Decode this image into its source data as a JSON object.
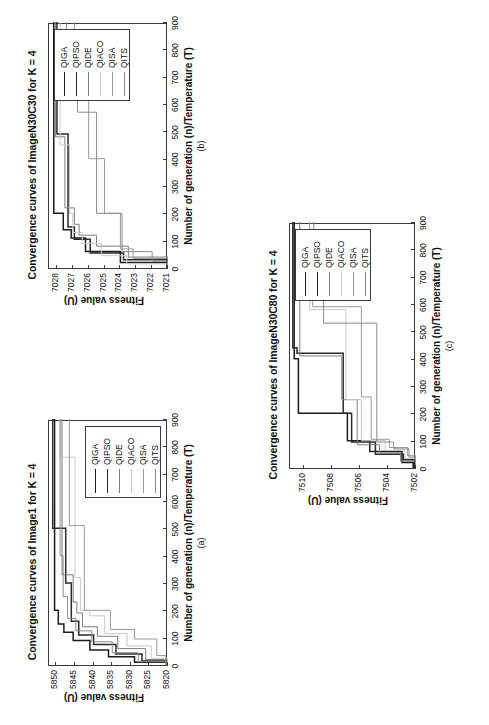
{
  "figure": {
    "series_names": [
      "QIGA",
      "QIPSO",
      "QIDE",
      "QIACO",
      "QISA",
      "QITS"
    ],
    "series_colors": [
      "#1c1c1c",
      "#2a2a2a",
      "#7d7d7d",
      "#c9c9c9",
      "#9a9a9a",
      "#8a8a8a"
    ],
    "xaxis_title": "Number of generation (n)/Temperature (T)",
    "yaxis_title": "Fitness value (U)"
  },
  "panels": [
    {
      "letter": "(a)",
      "title": "Convergence curves of Image1 for K = 4",
      "chart_data": {
        "type": "line",
        "title": "Convergence curves of Image1 for K = 4",
        "xlabel": "Number of generation (n)/Temperature (T)",
        "ylabel": "Fitness value (U)",
        "xlim": [
          0,
          900
        ],
        "ylim": [
          5820,
          5852
        ],
        "xticks": [
          0,
          100,
          200,
          300,
          400,
          500,
          600,
          700,
          800,
          900
        ],
        "yticks": [
          5820,
          5825,
          5830,
          5835,
          5840,
          5845,
          5850
        ],
        "grid": false,
        "legend_position": "lower-right",
        "series": [
          {
            "name": "QIGA",
            "color": "#1c1c1c",
            "x": [
              0,
              10,
              30,
              55,
              90,
              120,
              150,
              200,
              900
            ],
            "y": [
              5820.5,
              5829,
              5836,
              5841,
              5845.5,
              5848,
              5849.5,
              5850.5,
              5850.5
            ]
          },
          {
            "name": "QIPSO",
            "color": "#2a2a2a",
            "x": [
              0,
              15,
              40,
              75,
              110,
              160,
              300,
              480,
              500,
              900
            ],
            "y": [
              5820.3,
              5827,
              5834,
              5840,
              5844,
              5846,
              5847.5,
              5847.5,
              5851,
              5851
            ]
          },
          {
            "name": "QIDE",
            "color": "#7d7d7d",
            "x": [
              0,
              20,
              60,
              105,
              140,
              190,
              230,
              300,
              330,
              900
            ],
            "y": [
              5820.2,
              5826,
              5833.5,
              5839,
              5843,
              5844.5,
              5845.5,
              5845.5,
              5848.5,
              5848.5
            ]
          },
          {
            "name": "QIACO",
            "color": "#c9c9c9",
            "x": [
              0,
              25,
              70,
              115,
              180,
              200,
              290,
              320,
              700,
              760,
              900
            ],
            "y": [
              5820.1,
              5824.5,
              5831,
              5837,
              5841,
              5843.5,
              5843.5,
              5845,
              5845,
              5849,
              5849
            ]
          },
          {
            "name": "QISA",
            "color": "#9a9a9a",
            "x": [
              0,
              35,
              95,
              130,
              185,
              200,
              480,
              510,
              900
            ],
            "y": [
              5820.6,
              5823,
              5829,
              5835.5,
              5835.5,
              5842.5,
              5842.5,
              5846.5,
              5846.5
            ]
          },
          {
            "name": "QITS",
            "color": "#8a8a8a",
            "x": [
              0,
              12,
              45,
              85,
              125,
              170,
              250,
              400,
              900
            ],
            "y": [
              5820.4,
              5828,
              5835,
              5840.5,
              5844.8,
              5847,
              5848.2,
              5849,
              5849
            ]
          }
        ]
      }
    },
    {
      "letter": "(b)",
      "title": "Convergence curves of ImageN30C30 for K = 4",
      "chart_data": {
        "type": "line",
        "title": "Convergence curves of ImageN30C30 for K = 4",
        "xlabel": "Number of generation (n)/Temperature (T)",
        "ylabel": "Fitness value (U)",
        "xlim": [
          0,
          900
        ],
        "ylim": [
          7021,
          7028.5
        ],
        "xticks": [
          0,
          100,
          200,
          300,
          400,
          500,
          600,
          700,
          800,
          900
        ],
        "yticks": [
          7021,
          7022,
          7023,
          7024,
          7025,
          7026,
          7027,
          7028
        ],
        "grid": false,
        "legend_position": "upper-right",
        "series": [
          {
            "name": "QIGA",
            "color": "#1c1c1c",
            "x": [
              0,
              20,
              50,
              60,
              100,
              110,
              140,
              200,
              900
            ],
            "y": [
              7021.0,
              7024.0,
              7024.0,
              7026.2,
              7026.2,
              7027.1,
              7027.6,
              7028.2,
              7028.2
            ]
          },
          {
            "name": "QIPSO",
            "color": "#2a2a2a",
            "x": [
              0,
              30,
              55,
              95,
              105,
              150,
              460,
              490,
              900
            ],
            "y": [
              7021.0,
              7023.8,
              7025.9,
              7025.9,
              7026.9,
              7027.3,
              7027.3,
              7028.0,
              7028.0
            ]
          },
          {
            "name": "QIDE",
            "color": "#7d7d7d",
            "x": [
              0,
              40,
              80,
              120,
              160,
              210,
              220,
              440,
              480,
              900
            ],
            "y": [
              7021.0,
              7023.5,
              7025.5,
              7026.6,
              7026.9,
              7026.9,
              7027.5,
              7027.5,
              7028.1,
              7028.1
            ]
          },
          {
            "name": "QIACO",
            "color": "#c9c9c9",
            "x": [
              0,
              15,
              45,
              90,
              130,
              200,
              420,
              450,
              900
            ],
            "y": [
              7021.0,
              7023.6,
              7025.2,
              7026.4,
              7027.0,
              7027.2,
              7027.2,
              7027.8,
              7027.8
            ]
          },
          {
            "name": "QISA",
            "color": "#9a9a9a",
            "x": [
              0,
              35,
              70,
              110,
              190,
              200,
              380,
              400,
              700,
              730,
              900
            ],
            "y": [
              7021.0,
              7023.2,
              7024.0,
              7024.0,
              7024.0,
              7025.0,
              7025.0,
              7026.0,
              7026.0,
              7026.9,
              7026.9
            ]
          },
          {
            "name": "QITS",
            "color": "#8a8a8a",
            "x": [
              0,
              25,
              60,
              100,
              185,
              200,
              540,
              570,
              760,
              790,
              900
            ],
            "y": [
              7021.0,
              7022.0,
              7023.9,
              7023.9,
              7023.9,
              7025.5,
              7025.5,
              7026.7,
              7026.7,
              7027.4,
              7027.4
            ]
          }
        ]
      }
    },
    {
      "letter": "(c)",
      "title": "Convergence curves of ImageN30C80 for K = 4",
      "chart_data": {
        "type": "line",
        "title": "Convergence curves of ImageN30C80 for K = 4",
        "xlabel": "Number of generation (n)/Temperature (T)",
        "ylabel": "Fitness value (U)",
        "xlim": [
          0,
          900
        ],
        "ylim": [
          7502,
          7511
        ],
        "xticks": [
          0,
          100,
          200,
          300,
          400,
          500,
          600,
          700,
          800,
          900
        ],
        "yticks": [
          7502,
          7504,
          7506,
          7508,
          7510
        ],
        "grid": false,
        "legend_position": "upper-right",
        "series": [
          {
            "name": "QIGA",
            "color": "#1c1c1c",
            "x": [
              0,
              20,
              40,
              60,
              90,
              100,
              180,
              200,
              380,
              400,
              900
            ],
            "y": [
              7502.2,
              7503.0,
              7503.0,
              7505.3,
              7505.3,
              7506.9,
              7506.9,
              7510.4,
              7510.4,
              7510.7,
              7510.7
            ]
          },
          {
            "name": "QIPSO",
            "color": "#2a2a2a",
            "x": [
              0,
              30,
              50,
              80,
              95,
              190,
              200,
              240,
              420,
              440,
              900
            ],
            "y": [
              7502.1,
              7502.9,
              7504.9,
              7504.9,
              7506.6,
              7506.6,
              7507.2,
              7507.2,
              7510.5,
              7510.8,
              7510.8
            ]
          },
          {
            "name": "QIDE",
            "color": "#7d7d7d",
            "x": [
              0,
              25,
              55,
              85,
              110,
              230,
              250,
              390,
              410,
              900
            ],
            "y": [
              7502.0,
              7503.1,
              7504.6,
              7506.2,
              7506.2,
              7506.2,
              7507.3,
              7507.3,
              7510.3,
              7510.3
            ]
          },
          {
            "name": "QIACO",
            "color": "#c9c9c9",
            "x": [
              0,
              35,
              65,
              100,
              115,
              230,
              250,
              560,
              580,
              900
            ],
            "y": [
              7502.0,
              7502.8,
              7504.2,
              7505.9,
              7505.9,
              7505.9,
              7507.0,
              7507.0,
              7509.6,
              7509.6
            ]
          },
          {
            "name": "QISA",
            "color": "#9a9a9a",
            "x": [
              0,
              45,
              75,
              105,
              240,
              260,
              560,
              590,
              620,
              900
            ],
            "y": [
              7502.0,
              7502.6,
              7503.9,
              7505.2,
              7505.2,
              7505.9,
              7505.9,
              7509.4,
              7509.6,
              7509.6
            ]
          },
          {
            "name": "QITS",
            "color": "#8a8a8a",
            "x": [
              0,
              40,
              70,
              95,
              200,
              230,
              500,
              530,
              600,
              620,
              900
            ],
            "y": [
              7502.0,
              7502.5,
              7503.6,
              7504.8,
              7504.8,
              7504.8,
              7504.8,
              7508.6,
              7508.6,
              7509.3,
              7509.3
            ]
          }
        ]
      }
    }
  ]
}
